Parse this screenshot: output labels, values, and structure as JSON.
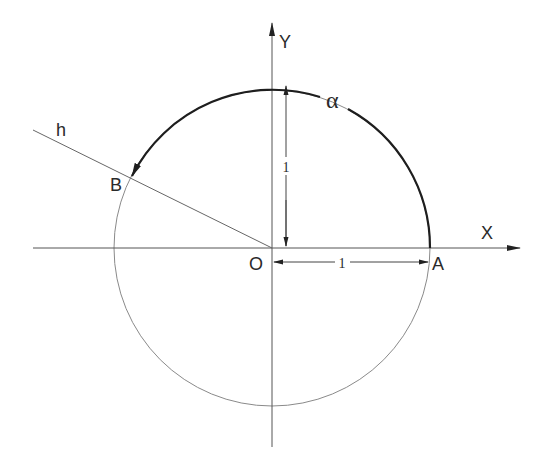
{
  "diagram": {
    "type": "unit-circle-angle",
    "labels": {
      "y_axis": "Y",
      "x_axis": "X",
      "origin": "O",
      "point_a": "A",
      "point_b": "B",
      "ray": "h",
      "angle": "α",
      "radius_vertical": "1",
      "radius_horizontal": "1"
    },
    "colors": {
      "axis": "#555555",
      "circle": "#8a8a8a",
      "arc": "#1e1e1e",
      "text": "#2a2a2a"
    },
    "geometry": {
      "origin": [
        272,
        248
      ],
      "radius": 158,
      "point_a": [
        430,
        248
      ],
      "point_b": [
        130,
        178
      ]
    }
  }
}
